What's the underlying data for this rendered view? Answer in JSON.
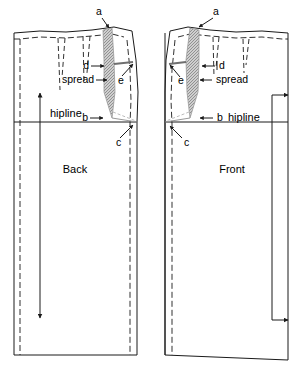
{
  "figure": {
    "type": "sewing-pattern-diagram",
    "ink_color": "#1a1a1a",
    "spread_fill": "#b5b5b5",
    "background": "#ffffff"
  },
  "pieces": [
    {
      "id": "back",
      "name_label": "Back",
      "hipline_label": "hipline",
      "darts": 2,
      "grainline_arrow": "up-down-vertical"
    },
    {
      "id": "front",
      "name_label": "Front",
      "hipline_label": "hipline",
      "darts": 2,
      "grainline_arrow": "right-pointing-bracket"
    }
  ],
  "callouts": {
    "back": [
      {
        "key": "a",
        "label": "a"
      },
      {
        "key": "b",
        "label": "b"
      },
      {
        "key": "c",
        "label": "c"
      },
      {
        "key": "d",
        "label": "d"
      },
      {
        "key": "e",
        "label": "e"
      },
      {
        "key": "spread",
        "label": "spread"
      }
    ],
    "front": [
      {
        "key": "a",
        "label": "a"
      },
      {
        "key": "b",
        "label": "b"
      },
      {
        "key": "c",
        "label": "c"
      },
      {
        "key": "d",
        "label": "d"
      },
      {
        "key": "e",
        "label": "e"
      },
      {
        "key": "spread",
        "label": "spread"
      }
    ]
  },
  "labels": {
    "back_name": "Back",
    "front_name": "Front",
    "back_hipline": "hipline",
    "front_hipline": "hipline",
    "back_a": "a",
    "back_b": "b",
    "back_c": "c",
    "back_d": "d",
    "back_e": "e",
    "back_spread": "spread",
    "front_a": "a",
    "front_b": "b",
    "front_c": "c",
    "front_d": "d",
    "front_e": "e",
    "front_spread": "spread"
  }
}
